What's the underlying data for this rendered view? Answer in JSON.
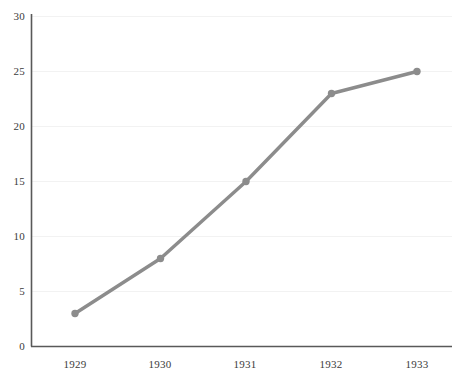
{
  "chart_data": {
    "type": "line",
    "title": "",
    "subtitle": "",
    "xlabel": "",
    "ylabel": "",
    "categories": [
      "1929",
      "1930",
      "1931",
      "1932",
      "1933"
    ],
    "values": [
      3,
      8,
      15,
      23,
      25
    ],
    "series": [
      {
        "name": "",
        "values": [
          3,
          8,
          15,
          23,
          25
        ]
      }
    ],
    "x": [
      1929,
      1930,
      1931,
      1932,
      1933
    ],
    "ylim": [
      0,
      30
    ],
    "ytick_labels": [
      "0",
      "5",
      "10",
      "15",
      "20",
      "25",
      "30"
    ],
    "ytick_values": [
      0,
      5,
      10,
      15,
      20,
      25,
      30
    ],
    "xtick_labels": [
      "1929",
      "1930",
      "1931",
      "1932",
      "1933"
    ],
    "grid": {
      "horizontal": true,
      "vertical": false
    },
    "legend": {
      "visible": false,
      "position": "none",
      "entries": []
    },
    "annotations": [],
    "style": {
      "line_color": "#8c8c8c",
      "marker_color": "#8c8c8c",
      "marker_shape": "circle",
      "grid_color": "#f2f2f2",
      "axis_color": "#595959",
      "background": "#ffffff",
      "tick_label_color": "#3b3b3b"
    }
  }
}
